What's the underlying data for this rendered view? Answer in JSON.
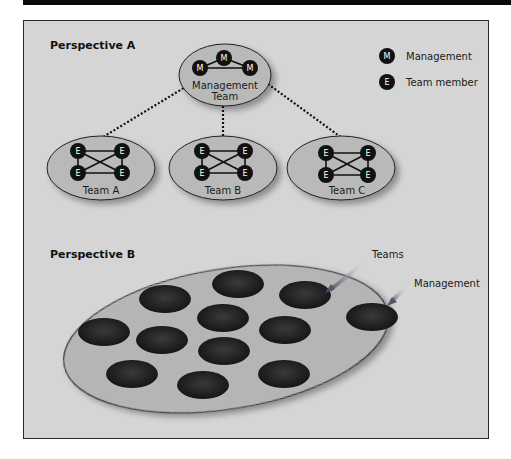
{
  "perspective_a": {
    "title": "Perspective A",
    "management_team": {
      "label_line1": "Management",
      "label_line2": "Team",
      "members": [
        "M",
        "M",
        "M"
      ]
    },
    "teams": [
      {
        "label": "Team A",
        "members": [
          "E",
          "E",
          "E",
          "E"
        ]
      },
      {
        "label": "Team B",
        "members": [
          "E",
          "E",
          "E",
          "E"
        ]
      },
      {
        "label": "Team C",
        "members": [
          "E",
          "E",
          "E",
          "E"
        ]
      }
    ],
    "legend": [
      {
        "symbol": "M",
        "label": "Management"
      },
      {
        "symbol": "E",
        "label": "Team member"
      }
    ]
  },
  "perspective_b": {
    "title": "Perspective B",
    "callouts": {
      "teams": "Teams",
      "management": "Management"
    },
    "team_oval_count": 12
  },
  "colors": {
    "frame_bg": "#d5d5d5",
    "ellipse_fill": "#b9b9b9",
    "node_fill": "#111111",
    "arrow": "#5a5a6e"
  }
}
